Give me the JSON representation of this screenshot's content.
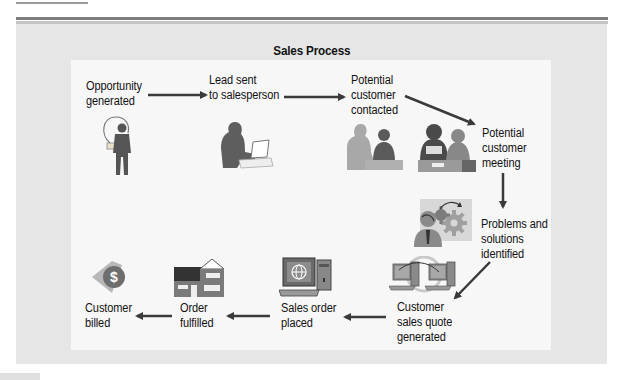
{
  "diagram": {
    "title": "Sales Process",
    "steps": [
      {
        "id": "opportunity",
        "label": "Opportunity\ngenerated",
        "icon": "lightbulb-person-icon"
      },
      {
        "id": "lead",
        "label": "Lead sent\nto salesperson",
        "icon": "person-laptop-icon"
      },
      {
        "id": "contacted",
        "label": "Potential\ncustomer\ncontacted",
        "icon": "two-people-talking-icon"
      },
      {
        "id": "meeting",
        "label": "Potential\ncustomer\nmeeting",
        "icon": "meeting-people-icon"
      },
      {
        "id": "problems",
        "label": "Problems and\nsolutions\nidentified",
        "icon": "thinking-gears-icon"
      },
      {
        "id": "quote",
        "label": "Customer\nsales quote\ngenerated",
        "icon": "networked-computers-icon"
      },
      {
        "id": "order",
        "label": "Sales order\nplaced",
        "icon": "web-computer-icon"
      },
      {
        "id": "fulfilled",
        "label": "Order\nfulfilled",
        "icon": "house-icon"
      },
      {
        "id": "billed",
        "label": "Customer\nbilled",
        "icon": "dollar-coin-icon"
      }
    ],
    "flow": [
      [
        "opportunity",
        "lead"
      ],
      [
        "lead",
        "contacted"
      ],
      [
        "contacted",
        "meeting"
      ],
      [
        "meeting",
        "problems"
      ],
      [
        "problems",
        "quote"
      ],
      [
        "quote",
        "order"
      ],
      [
        "order",
        "fulfilled"
      ],
      [
        "fulfilled",
        "billed"
      ]
    ],
    "colors": {
      "outer_panel": "#e6e6e6",
      "inner_panel": "#f7f7f7",
      "arrow": "#3a3a3a",
      "figure_dark": "#555555",
      "figure_light": "#9a9a9a"
    }
  }
}
